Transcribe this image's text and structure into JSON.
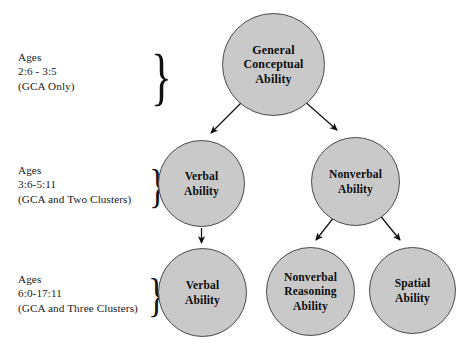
{
  "diagram": {
    "background_color": "#ffffff",
    "node_fill_color": "#c9c9c9",
    "node_border_color": "#4a4a4a",
    "text_color": "#111111"
  },
  "age_levels": [
    {
      "id": "level-1",
      "lines": [
        "Ages",
        "2:6 - 3:5",
        "(GCA Only)"
      ],
      "line1": "Ages",
      "line2": "2:6 - 3:5",
      "line3": "(GCA Only)",
      "brace": "}"
    },
    {
      "id": "level-2",
      "lines": [
        "Ages",
        "3:6-5:11",
        "(GCA and Two Clusters)"
      ],
      "line1": "Ages",
      "line2": "3:6-5:11",
      "line3": "(GCA and Two Clusters)",
      "brace": "}"
    },
    {
      "id": "level-3",
      "lines": [
        "Ages",
        "6:0-17:11",
        "(GCA and Three Clusters)"
      ],
      "line1": "Ages",
      "line2": "6:0-17:11",
      "line3": "(GCA and Three Clusters)",
      "brace": "}"
    }
  ],
  "nodes": {
    "gca": {
      "label": "General Conceptual Ability",
      "line1": "General",
      "line2": "Conceptual",
      "line3": "Ability"
    },
    "verbal_level2": {
      "label": "Verbal Ability",
      "line1": "Verbal",
      "line2": "Ability"
    },
    "nonverbal_level2": {
      "label": "Nonverbal Ability",
      "line1": "Nonverbal",
      "line2": "Ability"
    },
    "verbal_level3": {
      "label": "Verbal Ability",
      "line1": "Verbal",
      "line2": "Ability"
    },
    "nonverbal_reasoning_level3": {
      "label": "Nonverbal Reasoning Ability",
      "line1": "Nonverbal",
      "line2": "Reasoning",
      "line3": "Ability"
    },
    "spatial_level3": {
      "label": "Spatial Ability",
      "line1": "Spatial",
      "line2": "Ability"
    }
  },
  "edges": [
    {
      "id": "gca-to-verbal2",
      "from": "gca",
      "to": "verbal_level2"
    },
    {
      "id": "gca-to-nonverbal2",
      "from": "gca",
      "to": "nonverbal_level2"
    },
    {
      "id": "verbal2-to-verbal3",
      "from": "verbal_level2",
      "to": "verbal_level3"
    },
    {
      "id": "nonverbal2-to-nvreason3",
      "from": "nonverbal_level2",
      "to": "nonverbal_reasoning_level3"
    },
    {
      "id": "nonverbal2-to-spatial3",
      "from": "nonverbal_level2",
      "to": "spatial_level3"
    }
  ]
}
